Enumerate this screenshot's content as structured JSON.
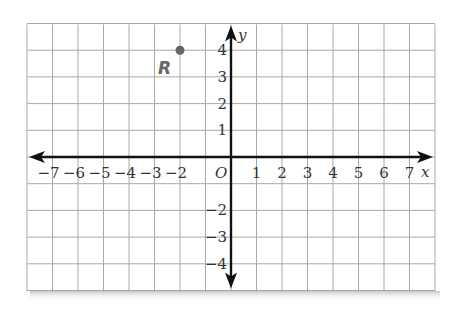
{
  "chart_data": {
    "type": "scatter",
    "title": "",
    "xlabel": "x",
    "ylabel": "y",
    "origin_label": "O",
    "xlim": [
      -8,
      8
    ],
    "ylim": [
      -5,
      5
    ],
    "grid": true,
    "x_tick_labels": [
      "−7",
      "−6",
      "−5",
      "−4",
      "−3",
      "−2",
      "1",
      "2",
      "3",
      "4",
      "5",
      "6",
      "7"
    ],
    "x_tick_values": [
      -7,
      -6,
      -5,
      -4,
      -3,
      -2,
      1,
      2,
      3,
      4,
      5,
      6,
      7
    ],
    "y_tick_labels": [
      "4",
      "3",
      "2",
      "1",
      "−2",
      "−3",
      "−4"
    ],
    "y_tick_values": [
      4,
      3,
      2,
      1,
      -2,
      -3,
      -4
    ],
    "points": [
      {
        "label": "R",
        "x": -2,
        "y": 4,
        "color": "#666666"
      }
    ]
  }
}
